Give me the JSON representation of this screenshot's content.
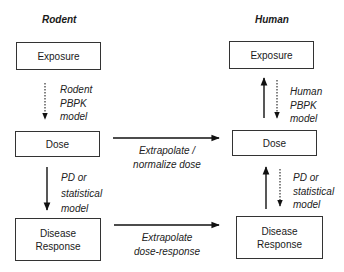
{
  "columns": {
    "rodent": {
      "title": "Rodent",
      "exposure": "Exposure",
      "dose": "Dose",
      "response": "Disease\nResponse",
      "pbpk_label": "Rodent\nPBPK\nmodel",
      "pd_label": "PD or\nstatistical\nmodel"
    },
    "human": {
      "title": "Human",
      "exposure": "Exposure",
      "dose": "Dose",
      "response": "Disease\nResponse",
      "pbpk_label": "Human\nPBPK\nmodel",
      "pd_label": "PD or\nstatistical\nmodel"
    }
  },
  "cross": {
    "dose_label": "Extrapolate /\nnormalize dose",
    "response_label": "Extrapolate\ndose-response"
  }
}
